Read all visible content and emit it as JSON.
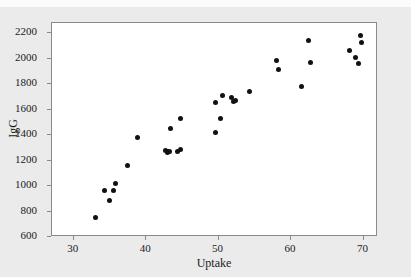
{
  "figure": {
    "background_color": "#ebebeb",
    "plot_background_color": "#ffffff",
    "frame_color": "#8a8a8a",
    "marker_color": "#111111",
    "top_strip_text": ""
  },
  "chart_data": {
    "type": "scatter",
    "title": "",
    "xlabel": "Uptake",
    "ylabel": "IgG",
    "xlim": [
      27,
      72
    ],
    "ylim": [
      600,
      2280
    ],
    "xticks": [
      30,
      40,
      50,
      60,
      70
    ],
    "yticks": [
      600,
      800,
      1000,
      1200,
      1400,
      1600,
      1800,
      2000,
      2200
    ],
    "xtick_labels": [
      "30",
      "40",
      "50",
      "60",
      "70"
    ],
    "ytick_labels": [
      "600",
      "800",
      "1000",
      "1200",
      "1400",
      "1600",
      "1800",
      "2000",
      "2200"
    ],
    "grid": false,
    "legend": null,
    "marker": "filled-circle",
    "series": [
      {
        "name": "IgG vs Uptake",
        "x": [
          33.0,
          34.3,
          35.0,
          35.5,
          35.7,
          37.4,
          38.8,
          42.7,
          42.9,
          43.0,
          43.2,
          43.4,
          44.3,
          44.7,
          44.8,
          49.5,
          49.6,
          50.2,
          50.5,
          51.8,
          52.1,
          52.3,
          54.3,
          58.0,
          58.2,
          61.4,
          62.4,
          62.7,
          68.0,
          68.9,
          69.3,
          69.6,
          69.7
        ],
        "y": [
          754,
          966,
          884,
          964,
          1021,
          1160,
          1382,
          1279,
          1262,
          1269,
          1268,
          1455,
          1272,
          1286,
          1531,
          1422,
          1652,
          1532,
          1714,
          1692,
          1666,
          1670,
          1743,
          1989,
          1913,
          1783,
          2145,
          1970,
          2068,
          2006,
          1962,
          2178,
          2125
        ],
        "n_points": 33
      }
    ]
  }
}
